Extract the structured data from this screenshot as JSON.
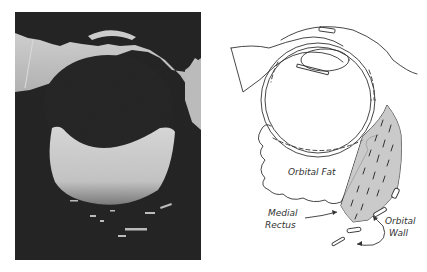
{
  "figure": {
    "left_panel": {
      "kind": "ultrasound-scan",
      "description": "B-scan ultrasound image of the eye and orbit"
    },
    "right_panel": {
      "kind": "anatomical-line-drawing",
      "labels": {
        "orbital_fat": "Orbital Fat",
        "medial_rectus_line1": "Medial",
        "medial_rectus_line2": "Rectus",
        "orbital_wall_line1": "Orbital",
        "orbital_wall_line2": "Wall"
      }
    }
  }
}
